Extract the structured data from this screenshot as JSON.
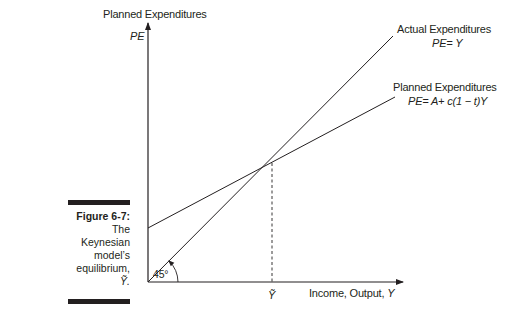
{
  "figure": {
    "caption_label": "Figure 6-7:",
    "caption_lines": [
      "The",
      "Keynesian",
      "model’s",
      "equilibrium,",
      "Ỹ."
    ]
  },
  "axes": {
    "y_title": "Planned Expenditures",
    "y_symbol": "PE",
    "x_title": "Income, Output, Y",
    "x_title_prefix": "Income, Output, ",
    "x_title_var": "Y",
    "equilibrium_tick": "Ỹ",
    "angle_label": "45°"
  },
  "lines": [
    {
      "name": "Actual Expenditures",
      "equation": "PE= Y",
      "style": "solid",
      "slope_deg": 45
    },
    {
      "name": "Planned Expenditures",
      "equation": "PE= A+ c(1 − t)Y",
      "style": "solid"
    }
  ],
  "colors": {
    "ink": "#231f20",
    "background": "#ffffff"
  }
}
